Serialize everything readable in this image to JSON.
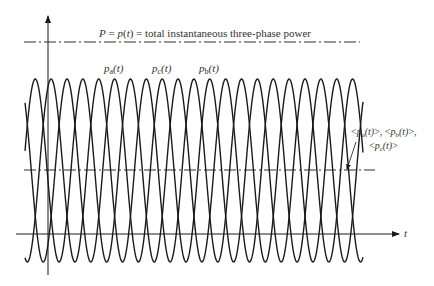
{
  "diagram": {
    "title_line_label": "P = p(t) = total instantaneous three-phase power",
    "title_line_label_parts": {
      "P": "P",
      "eq1": " = ",
      "p": "p",
      "t_open": "(",
      "t": "t",
      "t_close": ")",
      "rest": " = total instantaneous three-phase power"
    },
    "curves": [
      {
        "name": "p_a(t)",
        "base": "p",
        "sub": "a",
        "arg": "(t)"
      },
      {
        "name": "p_c(t)",
        "base": "p",
        "sub": "c",
        "arg": "(t)"
      },
      {
        "name": "p_b(t)",
        "base": "p",
        "sub": "b",
        "arg": "(t)"
      }
    ],
    "average_label_line1": "<p_a(t)>, <p_b(t)>,",
    "average_label_line2": "<p_c(t)>",
    "avg_parts": {
      "lt": "<",
      "gt": ">",
      "p": "p",
      "a": "a",
      "b": "b",
      "c": "c",
      "arg": "(t)",
      "comma": ", ",
      "trailing_comma": ","
    },
    "x_axis_label": "t",
    "colors": {
      "line": "#1a1a1a",
      "text": "#333333",
      "background": "#ffffff"
    }
  }
}
